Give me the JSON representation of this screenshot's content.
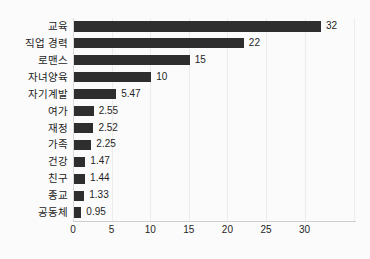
{
  "chart_data": {
    "type": "bar",
    "orientation": "horizontal",
    "title": "",
    "subtitle": "",
    "xlabel": "",
    "ylabel": "",
    "xlim": [
      0,
      33
    ],
    "xticks": [
      0,
      5,
      10,
      15,
      20,
      25,
      30
    ],
    "xtick_labels": [
      "0",
      "5",
      "10",
      "15",
      "20",
      "25",
      "30"
    ],
    "grid": true,
    "grid_axis": "x",
    "legend": false,
    "legend_position": "none",
    "bar_color": "#2e2e2e",
    "background_color": "#fbfbfb",
    "gridline_color": "#ececec",
    "value_labels_shown": true,
    "categories": [
      "교육",
      "직업 경력",
      "로맨스",
      "자녀양육",
      "자기계발",
      "여가",
      "재정",
      "가족",
      "건강",
      "친구",
      "종교",
      "공동체"
    ],
    "values": [
      32,
      22,
      15,
      10,
      5.47,
      2.55,
      2.52,
      2.25,
      1.47,
      1.44,
      1.33,
      0.95
    ],
    "value_labels": [
      "32",
      "22",
      "15",
      "10",
      "5.47",
      "2.55",
      "2.52",
      "2.25",
      "1.47",
      "1.44",
      "1.33",
      "0.95"
    ],
    "bars": [
      {
        "category": "교육",
        "value": 32,
        "label": "32"
      },
      {
        "category": "직업 경력",
        "value": 22,
        "label": "22"
      },
      {
        "category": "로맨스",
        "value": 15,
        "label": "15"
      },
      {
        "category": "자녀양육",
        "value": 10,
        "label": "10"
      },
      {
        "category": "자기계발",
        "value": 5.47,
        "label": "5.47"
      },
      {
        "category": "여가",
        "value": 2.55,
        "label": "2.55"
      },
      {
        "category": "재정",
        "value": 2.52,
        "label": "2.52"
      },
      {
        "category": "가족",
        "value": 2.25,
        "label": "2.25"
      },
      {
        "category": "건강",
        "value": 1.47,
        "label": "1.47"
      },
      {
        "category": "친구",
        "value": 1.44,
        "label": "1.44"
      },
      {
        "category": "종교",
        "value": 1.33,
        "label": "1.33"
      },
      {
        "category": "공동체",
        "value": 0.95,
        "label": "0.95"
      }
    ]
  }
}
